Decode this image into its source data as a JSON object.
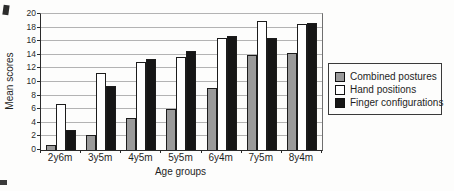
{
  "chart_data": {
    "type": "bar",
    "categories": [
      "2y6m",
      "3y5m",
      "4y5m",
      "5y5m",
      "6y4m",
      "7y5m",
      "8y4m"
    ],
    "series": [
      {
        "name": "Combined postures",
        "color": "#9a9a9a",
        "values": [
          0.8,
          2.2,
          4.7,
          6.0,
          9.1,
          14.0,
          14.2
        ]
      },
      {
        "name": "Hand positions",
        "color": "#ffffff",
        "values": [
          6.7,
          11.3,
          13.0,
          13.7,
          16.5,
          19.0,
          18.6
        ]
      },
      {
        "name": "Finger configurations",
        "color": "#161616",
        "values": [
          2.9,
          9.4,
          13.4,
          14.6,
          16.7,
          16.4,
          18.7
        ]
      }
    ],
    "xlabel": "Age groups",
    "ylabel": "Mean scores",
    "ylim": [
      0,
      20
    ],
    "ytick_step": 2,
    "grid": true,
    "legend_position": "right"
  }
}
